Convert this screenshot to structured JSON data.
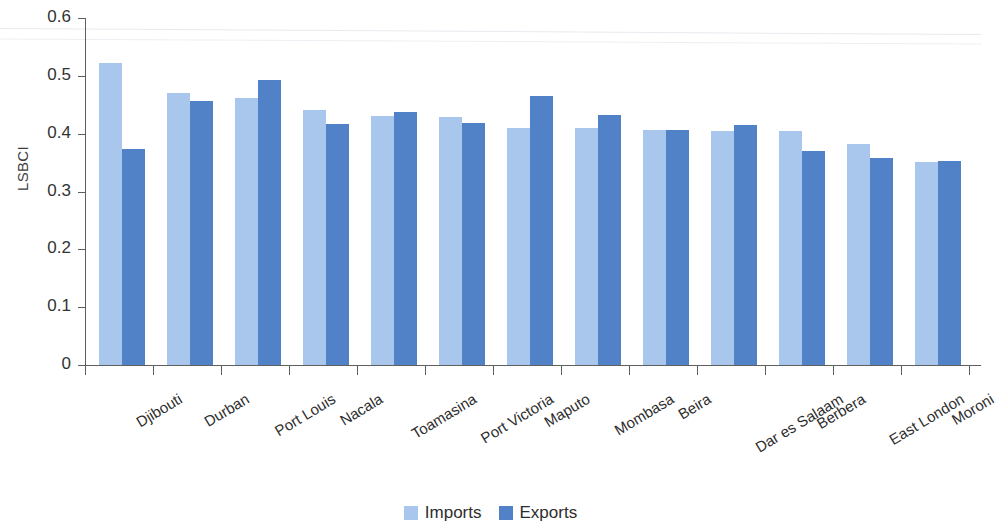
{
  "chart_data": {
    "type": "bar",
    "title": "",
    "xlabel": "",
    "ylabel": "LSBCI",
    "ylim": [
      0,
      0.6
    ],
    "ytick_labels": [
      "0.6",
      "0.5",
      "0.4",
      "0.3",
      "0.2",
      "0.1",
      "0"
    ],
    "ytick_values": [
      0.6,
      0.5,
      0.4,
      0.3,
      0.2,
      0.1,
      0
    ],
    "grid": false,
    "legend_position": "bottom-center",
    "categories": [
      "Djibouti",
      "Durban",
      "Port Louis",
      "Nacala",
      "Toamasina",
      "Port Victoria",
      "Maputo",
      "Mombasa",
      "Beira",
      "Dar es Salaam",
      "Berbera",
      "East London",
      "Moroni"
    ],
    "series": [
      {
        "name": "Imports",
        "color": "#a9c7ed",
        "values": [
          0.523,
          0.471,
          0.462,
          0.441,
          0.43,
          0.428,
          0.41,
          0.41,
          0.406,
          0.404,
          0.404,
          0.383,
          0.351
        ]
      },
      {
        "name": "Exports",
        "color": "#5182c8",
        "values": [
          0.374,
          0.456,
          0.492,
          0.417,
          0.438,
          0.419,
          0.466,
          0.432,
          0.406,
          0.415,
          0.37,
          0.358,
          0.353
        ]
      }
    ]
  }
}
